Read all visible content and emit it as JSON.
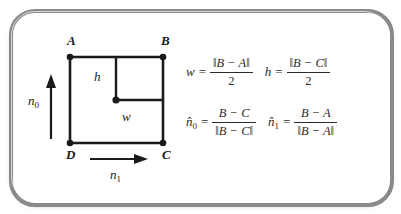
{
  "figure": {
    "type": "geometry-diagram-with-formulas",
    "background_color": "#ffffff",
    "frame_color": "#8a8a8a",
    "ink_color": "#1a1a1a",
    "formula_color": "#2b2b2b"
  },
  "diagram": {
    "name": "quad-with-half-extents",
    "vertices": [
      {
        "id": "A",
        "label": "A",
        "position": "top-left"
      },
      {
        "id": "B",
        "label": "B",
        "position": "top-right"
      },
      {
        "id": "C",
        "label": "C",
        "position": "bottom-right"
      },
      {
        "id": "D",
        "label": "D",
        "position": "bottom-left"
      }
    ],
    "inner_center_label": "center-point",
    "measure_labels": {
      "height": "h",
      "width": "w"
    },
    "basis_vectors": [
      {
        "id": "n0",
        "base": "n",
        "subscript": "0",
        "direction": "up",
        "side": "left"
      },
      {
        "id": "n1",
        "base": "n",
        "subscript": "1",
        "direction": "right",
        "side": "bottom"
      }
    ]
  },
  "formulas": {
    "rows": [
      [
        {
          "id": "w",
          "lhs_base": "w",
          "lhs_subscript": "",
          "equals": "=",
          "numerator": "‖B − A‖",
          "denominator": "2",
          "denominator_upright": true
        },
        {
          "id": "h",
          "lhs_base": "h",
          "lhs_subscript": "",
          "equals": "=",
          "numerator": "‖B − C‖",
          "denominator": "2",
          "denominator_upright": true
        }
      ],
      [
        {
          "id": "n0",
          "lhs_base": "n̂",
          "lhs_subscript": "0",
          "equals": "=",
          "numerator": "B − C",
          "denominator": "‖B − C‖",
          "denominator_upright": false
        },
        {
          "id": "n1",
          "lhs_base": "n̂",
          "lhs_subscript": "1",
          "equals": "=",
          "numerator": "B − A",
          "denominator": "‖B − A‖",
          "denominator_upright": false
        }
      ]
    ]
  }
}
